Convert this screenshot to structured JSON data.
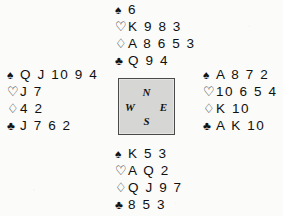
{
  "diagram": {
    "kind": "bridge-deal-diagram",
    "suit_glyphs": {
      "spade": "♠",
      "heart": "♡",
      "diamond": "♢",
      "club": "♣"
    },
    "colors": {
      "ink": "#101010",
      "page_background": "#fbfbfa",
      "compass_fill": "#d6d6d4",
      "compass_border": "#4a4a4a"
    }
  },
  "compass": {
    "north_label": "N",
    "west_label": "W",
    "east_label": "E",
    "south_label": "S"
  },
  "hands": {
    "north": {
      "seat_label": "North",
      "spades_pip": "♠",
      "spades": "6",
      "hearts_pip": "♡",
      "hearts": "K 9 8 3",
      "diamonds_pip": "♢",
      "diamonds": "A 8 6 5 3",
      "clubs_pip": "♣",
      "clubs": "Q 9 4"
    },
    "west": {
      "seat_label": "West",
      "spades_pip": "♠",
      "spades": "Q J 10 9 4",
      "hearts_pip": "♡",
      "hearts": "J 7",
      "diamonds_pip": "♢",
      "diamonds": "4 2",
      "clubs_pip": "♣",
      "clubs": "J 7 6 2"
    },
    "east": {
      "seat_label": "East",
      "spades_pip": "♠",
      "spades": "A 8 7 2",
      "hearts_pip": "♡",
      "hearts": "10 6 5 4",
      "diamonds_pip": "♢",
      "diamonds": "K 10",
      "clubs_pip": "♣",
      "clubs": "A K 10"
    },
    "south": {
      "seat_label": "South",
      "spades_pip": "♠",
      "spades": "K 5 3",
      "hearts_pip": "♡",
      "hearts": "A Q 2",
      "diamonds_pip": "♢",
      "diamonds": "Q J 9 7",
      "clubs_pip": "♣",
      "clubs": "8 5 3"
    }
  }
}
